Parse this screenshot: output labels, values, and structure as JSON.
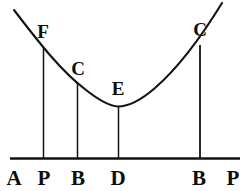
{
  "figure": {
    "ink_color": "#121212",
    "background_color": "#ffffff",
    "curve": {
      "name": "convex-curve",
      "description": "U-shaped convex curve, minimum near point E",
      "start_point": [
        14,
        10
      ],
      "vertex_point": [
        118,
        106
      ],
      "end_point": [
        222,
        3
      ]
    },
    "baseline": {
      "name": "base-line",
      "y": 158,
      "x_start": 10,
      "x_end": 240
    },
    "curve_labels": [
      {
        "text": "F",
        "x": 43,
        "y": 31
      },
      {
        "text": "C",
        "x": 78,
        "y": 68
      },
      {
        "text": "E",
        "x": 118,
        "y": 88
      },
      {
        "text": "C",
        "x": 200,
        "y": 29
      }
    ],
    "axis_labels": [
      {
        "text": "A",
        "x": 14,
        "y": 178
      },
      {
        "text": "P",
        "x": 44,
        "y": 178
      },
      {
        "text": "B",
        "x": 78,
        "y": 178
      },
      {
        "text": "D",
        "x": 118,
        "y": 178
      },
      {
        "text": "B",
        "x": 199,
        "y": 178
      },
      {
        "text": "P",
        "x": 233,
        "y": 178
      }
    ],
    "ordinates": [
      {
        "name": "ordinate-FP",
        "x": 43,
        "y_top": 47,
        "y_bottom": 158
      },
      {
        "name": "ordinate-CB",
        "x": 77,
        "y_top": 83,
        "y_bottom": 158
      },
      {
        "name": "ordinate-ED",
        "x": 118,
        "y_top": 107,
        "y_bottom": 158
      },
      {
        "name": "ordinate-CB-right",
        "x": 200,
        "y_top": 45,
        "y_bottom": 158
      }
    ]
  }
}
